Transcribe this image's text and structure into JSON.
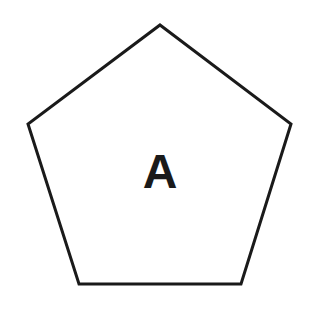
{
  "diagram": {
    "shape": "pentagon",
    "label": "A",
    "stroke_color": "#1a1a1a",
    "fill_color": "#ffffff",
    "stroke_width": 3,
    "vertices": [
      [
        160,
        25
      ],
      [
        291,
        124
      ],
      [
        241,
        284
      ],
      [
        79,
        284
      ],
      [
        28,
        124
      ]
    ],
    "label_position": [
      160,
      171
    ]
  }
}
